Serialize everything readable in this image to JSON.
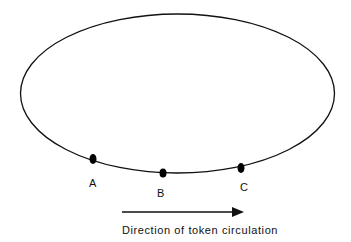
{
  "diagram": {
    "ring": {
      "shape": "ellipse",
      "color": "#111111"
    },
    "nodes": [
      {
        "id": "A",
        "label": "A"
      },
      {
        "id": "B",
        "label": "B"
      },
      {
        "id": "C",
        "label": "C"
      }
    ],
    "arrow": {
      "direction": "right"
    },
    "caption": "Direction of token circulation"
  }
}
